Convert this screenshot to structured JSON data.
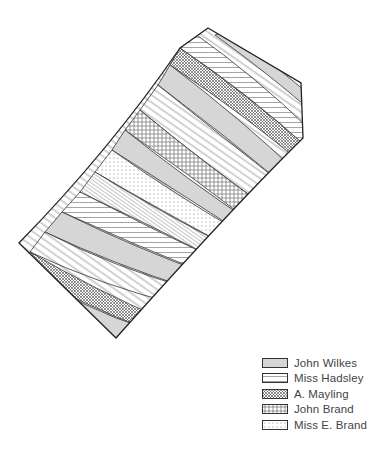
{
  "figure": {
    "type": "field-strip-map"
  },
  "legend": {
    "items": [
      {
        "label": "John Wilkes",
        "pattern": "dense-horizontal-lines",
        "pattern_id": "p-wilkes"
      },
      {
        "label": "Miss Hadsley",
        "pattern": "sparse-horizontal-lines",
        "pattern_id": "p-hadsley"
      },
      {
        "label": "A. Mayling",
        "pattern": "crosshatch",
        "pattern_id": "p-mayling"
      },
      {
        "label": "John Brand",
        "pattern": "grid",
        "pattern_id": "p-brand"
      },
      {
        "label": "Miss E. Brand",
        "pattern": "dots",
        "pattern_id": "p-ebrand"
      }
    ]
  },
  "colors": {
    "outline": "#222222",
    "hatch": "#555555",
    "background": "#ffffff"
  }
}
